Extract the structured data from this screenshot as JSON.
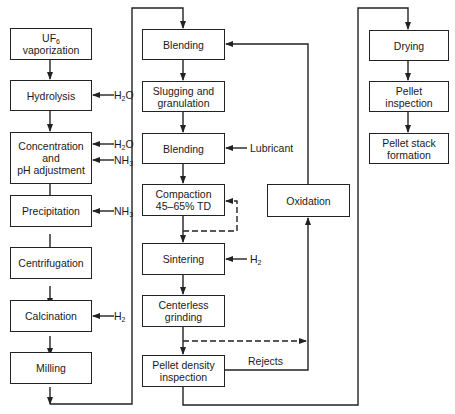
{
  "diagram": {
    "title": "",
    "columns": {
      "left": [
        {
          "id": "uf6",
          "lines": [
            "UF",
            "vaporization"
          ],
          "subscript": "6"
        },
        {
          "id": "hydrolysis",
          "label": "Hydrolysis"
        },
        {
          "id": "concentration",
          "lines": [
            "Concentration",
            "and",
            "pH adjustment"
          ]
        },
        {
          "id": "precipitation",
          "label": "Precipitation"
        },
        {
          "id": "centrifugation",
          "label": "Centrifugation"
        },
        {
          "id": "calcination",
          "label": "Calcination"
        },
        {
          "id": "milling",
          "label": "Milling"
        }
      ],
      "middle": [
        {
          "id": "blending1",
          "label": "Blending"
        },
        {
          "id": "slugging",
          "lines": [
            "Slugging and",
            "granulation"
          ]
        },
        {
          "id": "blending2",
          "label": "Blending"
        },
        {
          "id": "compaction",
          "lines": [
            "Compaction",
            "45–65% TD"
          ]
        },
        {
          "id": "sintering",
          "label": "Sintering"
        },
        {
          "id": "grinding",
          "lines": [
            "Centerless",
            "grinding"
          ]
        },
        {
          "id": "density",
          "lines": [
            "Pellet density",
            "inspection"
          ]
        }
      ],
      "recycle": [
        {
          "id": "oxidation",
          "label": "Oxidation"
        }
      ],
      "right": [
        {
          "id": "drying",
          "label": "Drying"
        },
        {
          "id": "pellet_inspection",
          "lines": [
            "Pellet",
            "inspection"
          ]
        },
        {
          "id": "stack",
          "lines": [
            "Pellet stack",
            "formation"
          ]
        }
      ]
    },
    "inputs": {
      "hydrolysis_h2o": {
        "base": "H",
        "sub": "2",
        "rest": "O"
      },
      "conc_h2o": {
        "base": "H",
        "sub": "2",
        "rest": "O"
      },
      "conc_nh3": {
        "base": "NH",
        "sub": "3",
        "rest": ""
      },
      "precip_nh3": {
        "base": "NH",
        "sub": "3",
        "rest": ""
      },
      "calc_h2": {
        "base": "H",
        "sub": "2",
        "rest": ""
      },
      "lubricant": "Lubricant",
      "sinter_h2": {
        "base": "H",
        "sub": "2",
        "rest": ""
      }
    },
    "edge_labels": {
      "rejects": "Rejects"
    },
    "colors": {
      "line": "#222222",
      "background": "#ffffff"
    }
  }
}
